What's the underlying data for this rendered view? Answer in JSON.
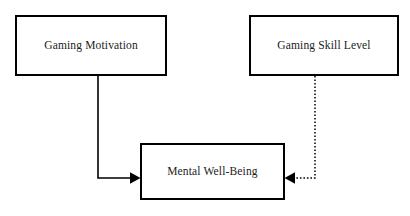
{
  "diagram": {
    "background_color": "#ffffff",
    "line_color": "#000000",
    "text_color": "#1b1b1b",
    "nodes": [
      {
        "id": "gaming-motivation",
        "label": "Gaming Motivation",
        "shape": "rectangle"
      },
      {
        "id": "gaming-skill-level",
        "label": "Gaming Skill Level",
        "shape": "rectangle"
      },
      {
        "id": "mental-well-being",
        "label": "Mental Well-Being",
        "shape": "rectangle"
      }
    ],
    "edges": [
      {
        "id": "motivation-to-wellbeing",
        "from": "gaming-motivation",
        "to": "mental-well-being",
        "style": "solid",
        "arrow": "single",
        "direction": "down-then-right"
      },
      {
        "id": "skill-to-wellbeing",
        "from": "gaming-skill-level",
        "to": "mental-well-being",
        "style": "dotted",
        "arrow": "single",
        "direction": "down-then-left"
      }
    ]
  }
}
